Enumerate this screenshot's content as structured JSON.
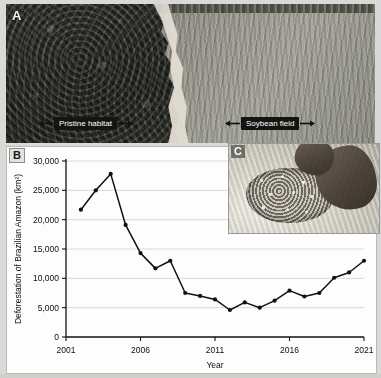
{
  "figure": {
    "panels": [
      {
        "letter": "A",
        "name": "aerial-photo"
      },
      {
        "letter": "B",
        "name": "deforestation-chart"
      },
      {
        "letter": "C",
        "name": "soybean-photo"
      }
    ]
  },
  "panel_a": {
    "letter": "A",
    "labels": [
      {
        "text": "Pristine habitat",
        "name": "pristine-habitat-label"
      },
      {
        "text": "Soybean field",
        "name": "soybean-field-label"
      }
    ]
  },
  "panel_b": {
    "letter": "B"
  },
  "panel_c": {
    "letter": "C"
  },
  "chart_data": {
    "type": "line",
    "title": "",
    "xlabel": "Year",
    "ylabel": "Deforestation of Brazilian Amazon (km²)",
    "xlim": [
      2001,
      2021
    ],
    "ylim": [
      0,
      30000
    ],
    "xticks": [
      2001,
      2006,
      2011,
      2016,
      2021
    ],
    "xticklabels": [
      "2001",
      "2006",
      "2011",
      "2016",
      "2021"
    ],
    "yticks": [
      0,
      5000,
      10000,
      15000,
      20000,
      25000,
      30000
    ],
    "yticklabels": [
      "0",
      "5,000",
      "10,000",
      "15,000",
      "20,000",
      "25,000",
      "30,000"
    ],
    "grid": true,
    "grid_axis": "y",
    "legend": false,
    "marker": "filled-circle",
    "line_color": "#111111",
    "x": [
      2002,
      2003,
      2004,
      2005,
      2006,
      2007,
      2008,
      2009,
      2010,
      2011,
      2012,
      2013,
      2014,
      2015,
      2016,
      2017,
      2018,
      2019,
      2020,
      2021
    ],
    "values": [
      21700,
      25000,
      27800,
      19100,
      14300,
      11700,
      13000,
      7500,
      7000,
      6400,
      4600,
      5900,
      5000,
      6200,
      7900,
      6900,
      7500,
      10100,
      11000,
      13000
    ],
    "series": [
      {
        "name": "Deforestation of Brazilian Amazon",
        "values": [
          21700,
          25000,
          27800,
          19100,
          14300,
          11700,
          13000,
          7500,
          7000,
          6400,
          4600,
          5900,
          5000,
          6200,
          7900,
          6900,
          7500,
          10100,
          11000,
          13000
        ]
      }
    ]
  }
}
